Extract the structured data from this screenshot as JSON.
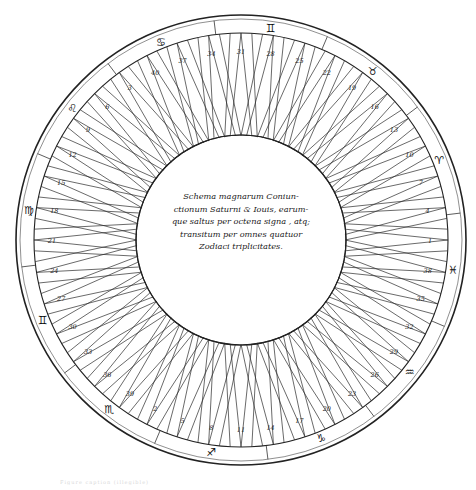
{
  "diagram": {
    "title_text_lines": [
      "Schema magnarum Coniun-",
      "ctionum Saturni & Iouis, earum-",
      "que saltus per octena signa , atq;",
      "transitum per omnes quatuor",
      "Zodiaci triplicitates."
    ],
    "ring": {
      "center": [
        241,
        240
      ],
      "outer_radius": 225,
      "sign_band_inner_radius": 207,
      "inner_radius": 105,
      "cell_count": 40,
      "cell_numbers_ccw_from_right": [
        1,
        4,
        7,
        10,
        13,
        16,
        19,
        22,
        25,
        28,
        31,
        34,
        37,
        40,
        3,
        6,
        9,
        12,
        15,
        18,
        21,
        24,
        27,
        30,
        33,
        36,
        39,
        2,
        5,
        8,
        11,
        14,
        17,
        20,
        23,
        26,
        29,
        32,
        35,
        38
      ]
    },
    "zodiac_signs": [
      {
        "name": "aries",
        "glyph": "♈",
        "angle_deg": 22
      },
      {
        "name": "taurus",
        "glyph": "♉",
        "angle_deg": 52
      },
      {
        "name": "gemini",
        "glyph": "♊",
        "angle_deg": 82
      },
      {
        "name": "cancer",
        "glyph": "♋",
        "angle_deg": 112
      },
      {
        "name": "leo",
        "glyph": "♌",
        "angle_deg": 142
      },
      {
        "name": "virgo",
        "glyph": "♍",
        "angle_deg": 172
      },
      {
        "name": "gemini-left",
        "glyph": "♊",
        "angle_deg": 202
      },
      {
        "name": "scorpio",
        "glyph": "♏",
        "angle_deg": 232
      },
      {
        "name": "sagittarius",
        "glyph": "♐",
        "angle_deg": 262
      },
      {
        "name": "capricorn",
        "glyph": "♑",
        "angle_deg": 292
      },
      {
        "name": "aquarius",
        "glyph": "♒",
        "angle_deg": 322
      },
      {
        "name": "pisces",
        "glyph": "♓",
        "angle_deg": 352
      }
    ],
    "caption": "Figure caption (illegible)"
  }
}
